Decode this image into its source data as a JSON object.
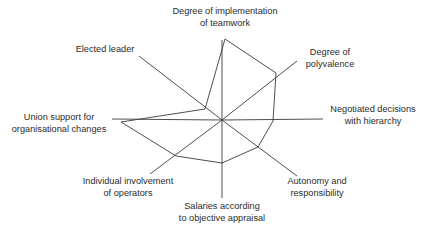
{
  "chart_data": {
    "type": "radar",
    "title": "",
    "center": [
      222,
      120
    ],
    "axes": [
      {
        "key": "teamwork",
        "label_lines": [
          "Degree of implementation",
          "of teamwork"
        ],
        "end": [
          222,
          40
        ]
      },
      {
        "key": "polyvalence",
        "label_lines": [
          "Degree of",
          "polyvalence"
        ],
        "end": [
          297,
          61
        ]
      },
      {
        "key": "negotiated",
        "label_lines": [
          "Negotiated decisions",
          "with hierarchy"
        ],
        "end": [
          323,
          119
        ]
      },
      {
        "key": "autonomy",
        "label_lines": [
          "Autonomy and",
          "responsibility"
        ],
        "end": [
          297,
          176
        ]
      },
      {
        "key": "salaries",
        "label_lines": [
          "Salaries according",
          "to objective appraisal"
        ],
        "end": [
          222,
          198
        ]
      },
      {
        "key": "individual",
        "label_lines": [
          "Individual involvement",
          "of operators"
        ],
        "end": [
          150,
          174
        ]
      },
      {
        "key": "union",
        "label_lines": [
          "Union support for",
          "organisational changes"
        ],
        "end": [
          112,
          119
        ]
      },
      {
        "key": "elected",
        "label_lines": [
          "Elected leader"
        ],
        "end": [
          139,
          56
        ]
      }
    ],
    "series": [
      {
        "name": "profile",
        "values_relative": {
          "teamwork": 1.0,
          "polyvalence": 0.75,
          "negotiated": 0.5,
          "autonomy": 0.5,
          "salaries": 0.55,
          "individual": 0.65,
          "union": 0.9,
          "elected": 0.2
        },
        "polygon": [
          [
            225,
            39
          ],
          [
            276,
            73
          ],
          [
            273,
            121
          ],
          [
            258,
            147
          ],
          [
            222,
            163
          ],
          [
            176,
            156
          ],
          [
            121,
            122
          ],
          [
            205,
            109
          ]
        ]
      }
    ],
    "grid": false,
    "legend": null
  },
  "labels": {
    "teamwork": {
      "l1": "Degree of implementation",
      "l2": "of teamwork"
    },
    "polyvalence": {
      "l1": "Degree of",
      "l2": "polyvalence"
    },
    "negotiated": {
      "l1": "Negotiated decisions",
      "l2": "with hierarchy"
    },
    "autonomy": {
      "l1": "Autonomy and",
      "l2": "responsibility"
    },
    "salaries": {
      "l1": "Salaries according",
      "l2": "to objective appraisal"
    },
    "individual": {
      "l1": "Individual involvement",
      "l2": "of operators"
    },
    "union": {
      "l1": "Union support for",
      "l2": "organisational changes"
    },
    "elected": {
      "l1": "Elected leader"
    }
  },
  "colors": {
    "line": "#3a3a3a",
    "text": "#2b2b2b",
    "background": "#ffffff"
  }
}
